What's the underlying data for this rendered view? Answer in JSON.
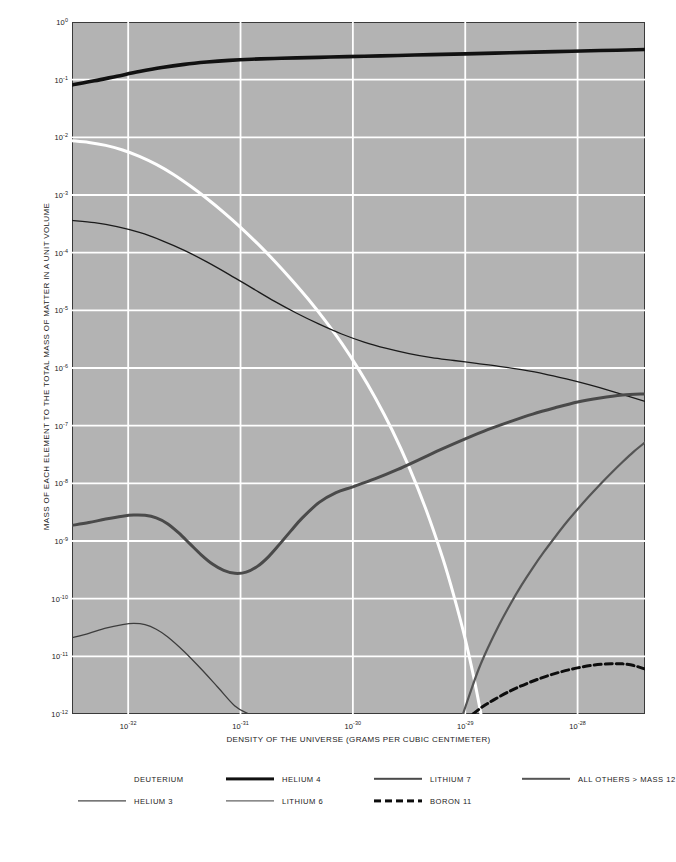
{
  "chart_data": {
    "type": "line",
    "title": "",
    "xlabel": "DENSITY OF THE UNIVERSE (GRAMS PER CUBIC CENTIMETER)",
    "ylabel": "MASS OF EACH ELEMENT TO THE TOTAL MASS OF MATTER IN A UNIT VOLUME",
    "xscale": "log",
    "yscale": "log",
    "xlim": [
      -32.5,
      -27.4
    ],
    "ylim": [
      -12,
      0
    ],
    "grid": true,
    "legend_position": "below",
    "xticks": [
      {
        "exp": -32,
        "label": "10",
        "sup": "-32"
      },
      {
        "exp": -31,
        "label": "10",
        "sup": "-31"
      },
      {
        "exp": -30,
        "label": "10",
        "sup": "-30"
      },
      {
        "exp": -29,
        "label": "10",
        "sup": "-29"
      },
      {
        "exp": -28,
        "label": "10",
        "sup": "-28"
      }
    ],
    "yticks": [
      {
        "exp": 0,
        "label": "10",
        "sup": "0"
      },
      {
        "exp": -1,
        "label": "10",
        "sup": "-1"
      },
      {
        "exp": -2,
        "label": "10",
        "sup": "-2"
      },
      {
        "exp": -3,
        "label": "10",
        "sup": "-3"
      },
      {
        "exp": -4,
        "label": "10",
        "sup": "-4"
      },
      {
        "exp": -5,
        "label": "10",
        "sup": "-5"
      },
      {
        "exp": -6,
        "label": "10",
        "sup": "-6"
      },
      {
        "exp": -7,
        "label": "10",
        "sup": "-7"
      },
      {
        "exp": -8,
        "label": "10",
        "sup": "-8"
      },
      {
        "exp": -9,
        "label": "10",
        "sup": "-9"
      },
      {
        "exp": -10,
        "label": "10",
        "sup": "-10"
      },
      {
        "exp": -11,
        "label": "10",
        "sup": "-11"
      },
      {
        "exp": -12,
        "label": "10",
        "sup": "-12"
      }
    ],
    "series": [
      {
        "name": "HELIUM 4",
        "color": "#111111",
        "width": 3.6,
        "dash": "",
        "points": [
          [
            -32.5,
            -1.09
          ],
          [
            -32.3,
            -1.02
          ],
          [
            -32.1,
            -0.94
          ],
          [
            -31.9,
            -0.86
          ],
          [
            -31.7,
            -0.79
          ],
          [
            -31.5,
            -0.735
          ],
          [
            -31.3,
            -0.695
          ],
          [
            -31.1,
            -0.665
          ],
          [
            -30.9,
            -0.645
          ],
          [
            -30.7,
            -0.632
          ],
          [
            -30.5,
            -0.622
          ],
          [
            -30.2,
            -0.608
          ],
          [
            -29.9,
            -0.594
          ],
          [
            -29.6,
            -0.58
          ],
          [
            -29.3,
            -0.566
          ],
          [
            -29.0,
            -0.552
          ],
          [
            -28.6,
            -0.533
          ],
          [
            -28.2,
            -0.514
          ],
          [
            -27.8,
            -0.495
          ],
          [
            -27.4,
            -0.478
          ]
        ]
      },
      {
        "name": "DEUTERIUM",
        "color": "#ffffff",
        "width": 3.0,
        "dash": "",
        "points": [
          [
            -32.5,
            -2.06
          ],
          [
            -32.35,
            -2.09
          ],
          [
            -32.2,
            -2.14
          ],
          [
            -32.05,
            -2.22
          ],
          [
            -31.9,
            -2.33
          ],
          [
            -31.75,
            -2.47
          ],
          [
            -31.6,
            -2.64
          ],
          [
            -31.45,
            -2.84
          ],
          [
            -31.3,
            -3.06
          ],
          [
            -31.15,
            -3.3
          ],
          [
            -31.0,
            -3.56
          ],
          [
            -30.85,
            -3.84
          ],
          [
            -30.7,
            -4.14
          ],
          [
            -30.55,
            -4.46
          ],
          [
            -30.4,
            -4.8
          ],
          [
            -30.25,
            -5.17
          ],
          [
            -30.1,
            -5.57
          ],
          [
            -29.95,
            -6.02
          ],
          [
            -29.8,
            -6.52
          ],
          [
            -29.65,
            -7.08
          ],
          [
            -29.5,
            -7.72
          ],
          [
            -29.35,
            -8.45
          ],
          [
            -29.2,
            -9.3
          ],
          [
            -29.1,
            -9.96
          ],
          [
            -29.0,
            -10.7
          ],
          [
            -28.92,
            -11.4
          ],
          [
            -28.86,
            -12.0
          ]
        ]
      },
      {
        "name": "HELIUM 3",
        "color": "#1b1b1b",
        "width": 1.3,
        "dash": "",
        "points": [
          [
            -32.5,
            -3.44
          ],
          [
            -32.3,
            -3.48
          ],
          [
            -32.1,
            -3.55
          ],
          [
            -31.9,
            -3.65
          ],
          [
            -31.7,
            -3.79
          ],
          [
            -31.5,
            -3.96
          ],
          [
            -31.3,
            -4.16
          ],
          [
            -31.1,
            -4.38
          ],
          [
            -30.9,
            -4.61
          ],
          [
            -30.7,
            -4.84
          ],
          [
            -30.5,
            -5.05
          ],
          [
            -30.3,
            -5.24
          ],
          [
            -30.1,
            -5.41
          ],
          [
            -29.9,
            -5.55
          ],
          [
            -29.7,
            -5.66
          ],
          [
            -29.5,
            -5.75
          ],
          [
            -29.3,
            -5.82
          ],
          [
            -29.1,
            -5.87
          ],
          [
            -28.9,
            -5.92
          ],
          [
            -28.7,
            -5.97
          ],
          [
            -28.5,
            -6.03
          ],
          [
            -28.3,
            -6.1
          ],
          [
            -28.1,
            -6.19
          ],
          [
            -27.9,
            -6.29
          ],
          [
            -27.7,
            -6.4
          ],
          [
            -27.4,
            -6.58
          ]
        ]
      },
      {
        "name": "LITHIUM 7",
        "color": "#4a4a4a",
        "width": 3.0,
        "dash": "",
        "points": [
          [
            -32.5,
            -8.73
          ],
          [
            -32.35,
            -8.68
          ],
          [
            -32.2,
            -8.62
          ],
          [
            -32.05,
            -8.57
          ],
          [
            -31.95,
            -8.55
          ],
          [
            -31.85,
            -8.555
          ],
          [
            -31.75,
            -8.6
          ],
          [
            -31.65,
            -8.7
          ],
          [
            -31.55,
            -8.86
          ],
          [
            -31.45,
            -9.05
          ],
          [
            -31.35,
            -9.24
          ],
          [
            -31.25,
            -9.4
          ],
          [
            -31.15,
            -9.51
          ],
          [
            -31.05,
            -9.56
          ],
          [
            -30.95,
            -9.54
          ],
          [
            -30.85,
            -9.44
          ],
          [
            -30.75,
            -9.27
          ],
          [
            -30.65,
            -9.05
          ],
          [
            -30.55,
            -8.82
          ],
          [
            -30.45,
            -8.6
          ],
          [
            -30.3,
            -8.33
          ],
          [
            -30.15,
            -8.16
          ],
          [
            -30.0,
            -8.06
          ],
          [
            -29.8,
            -7.92
          ],
          [
            -29.6,
            -7.76
          ],
          [
            -29.4,
            -7.58
          ],
          [
            -29.2,
            -7.4
          ],
          [
            -29.0,
            -7.23
          ],
          [
            -28.8,
            -7.07
          ],
          [
            -28.6,
            -6.93
          ],
          [
            -28.4,
            -6.8
          ],
          [
            -28.2,
            -6.69
          ],
          [
            -28.0,
            -6.59
          ],
          [
            -27.8,
            -6.52
          ],
          [
            -27.6,
            -6.47
          ],
          [
            -27.4,
            -6.45
          ]
        ]
      },
      {
        "name": "LITHIUM 6",
        "color": "#3d3d3d",
        "width": 1.3,
        "dash": "",
        "points": [
          [
            -32.5,
            -10.68
          ],
          [
            -32.35,
            -10.6
          ],
          [
            -32.2,
            -10.51
          ],
          [
            -32.05,
            -10.45
          ],
          [
            -31.95,
            -10.43
          ],
          [
            -31.85,
            -10.45
          ],
          [
            -31.75,
            -10.53
          ],
          [
            -31.65,
            -10.66
          ],
          [
            -31.5,
            -10.92
          ],
          [
            -31.35,
            -11.22
          ],
          [
            -31.2,
            -11.54
          ],
          [
            -31.05,
            -11.86
          ],
          [
            -30.93,
            -12.0
          ]
        ]
      },
      {
        "name": "ALL OTHERS > MASS 12",
        "color": "#555555",
        "width": 2.2,
        "dash": "",
        "points": [
          [
            -29.02,
            -12.0
          ],
          [
            -28.95,
            -11.6
          ],
          [
            -28.88,
            -11.22
          ],
          [
            -28.8,
            -10.86
          ],
          [
            -28.7,
            -10.46
          ],
          [
            -28.6,
            -10.1
          ],
          [
            -28.5,
            -9.77
          ],
          [
            -28.4,
            -9.47
          ],
          [
            -28.3,
            -9.19
          ],
          [
            -28.2,
            -8.93
          ],
          [
            -28.1,
            -8.68
          ],
          [
            -28.0,
            -8.45
          ],
          [
            -27.9,
            -8.23
          ],
          [
            -27.8,
            -8.02
          ],
          [
            -27.7,
            -7.82
          ],
          [
            -27.6,
            -7.63
          ],
          [
            -27.5,
            -7.45
          ],
          [
            -27.4,
            -7.29
          ]
        ]
      },
      {
        "name": "BORON 11",
        "color": "#0d0d0d",
        "width": 3.0,
        "dash": "7,4",
        "points": [
          [
            -28.93,
            -12.0
          ],
          [
            -28.85,
            -11.88
          ],
          [
            -28.75,
            -11.76
          ],
          [
            -28.6,
            -11.6
          ],
          [
            -28.45,
            -11.47
          ],
          [
            -28.3,
            -11.36
          ],
          [
            -28.15,
            -11.27
          ],
          [
            -28.0,
            -11.2
          ],
          [
            -27.85,
            -11.15
          ],
          [
            -27.7,
            -11.13
          ],
          [
            -27.6,
            -11.13
          ],
          [
            -27.5,
            -11.16
          ],
          [
            -27.4,
            -11.22
          ]
        ]
      }
    ]
  },
  "legend": {
    "items": [
      {
        "label": "DEUTERIUM",
        "style": "band-white",
        "color": "#ffffff",
        "row": 0,
        "col": 0
      },
      {
        "label": "HELIUM 4",
        "style": "solid-thick",
        "color": "#111111",
        "row": 0,
        "col": 1
      },
      {
        "label": "LITHIUM 7",
        "style": "solid-medium",
        "color": "#4a4a4a",
        "row": 0,
        "col": 2
      },
      {
        "label": "ALL OTHERS > MASS 12",
        "style": "solid-medium",
        "color": "#555555",
        "row": 0,
        "col": 3
      },
      {
        "label": "HELIUM 3",
        "style": "solid-thin",
        "color": "#1b1b1b",
        "row": 1,
        "col": 0
      },
      {
        "label": "LITHIUM 6",
        "style": "solid-thin",
        "color": "#3d3d3d",
        "row": 1,
        "col": 1
      },
      {
        "label": "BORON 11",
        "style": "dashed-thick",
        "color": "#0d0d0d",
        "row": 1,
        "col": 2
      }
    ]
  },
  "colors": {
    "plot_background": "#b3b3b3",
    "gridline": "#ffffff",
    "frame": "#3a3a3a",
    "page_background": "#ffffff",
    "text": "#1a1a1a"
  }
}
